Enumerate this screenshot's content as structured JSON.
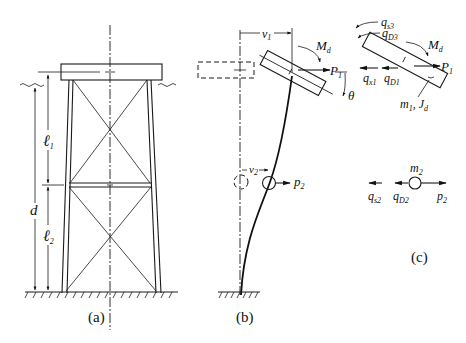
{
  "figure": {
    "panels": [
      {
        "id": "a",
        "caption": "(a)",
        "description": "Two-level braced offshore jacket platform with deck, water line, and seabed"
      },
      {
        "id": "b",
        "caption": "(b)",
        "description": "Deformed cantilever model with displaced deck mass and lumped mass"
      },
      {
        "id": "c",
        "caption": "(c)",
        "description": "Free-body diagrams of deck and lumped mass"
      }
    ],
    "panel_a": {
      "dim_l1": "ℓ",
      "dim_l1_sub": "1",
      "dim_l2": "ℓ",
      "dim_l2_sub": "2",
      "dim_d": "d"
    },
    "panel_b": {
      "v1": "v",
      "v1_sub": "1",
      "v2": "v",
      "v2_sub": "2",
      "Md": "M",
      "Md_sub": "d",
      "P1": "P",
      "P1_sub": "1",
      "P2": "p",
      "P2_sub": "2",
      "theta": "θ"
    },
    "panel_c": {
      "qs3": "q",
      "qs3_sub": "s3",
      "qD3": "q",
      "qD3_sub": "D3",
      "Md": "M",
      "Md_sub": "d",
      "P1": "P",
      "P1_sub": "1",
      "qx1": "q",
      "qx1_sub": "x1",
      "qD1": "q",
      "qD1_sub": "D1",
      "m1Jd": "m",
      "m1Jd_sub": "1",
      "m1Jd_tail": ", J",
      "m1Jd_tail_sub": "d",
      "m2": "m",
      "m2_sub": "2",
      "qs2": "q",
      "qs2_sub": "s2",
      "qD2": "q",
      "qD2_sub": "D2",
      "p2": "p",
      "p2_sub": "2"
    }
  }
}
